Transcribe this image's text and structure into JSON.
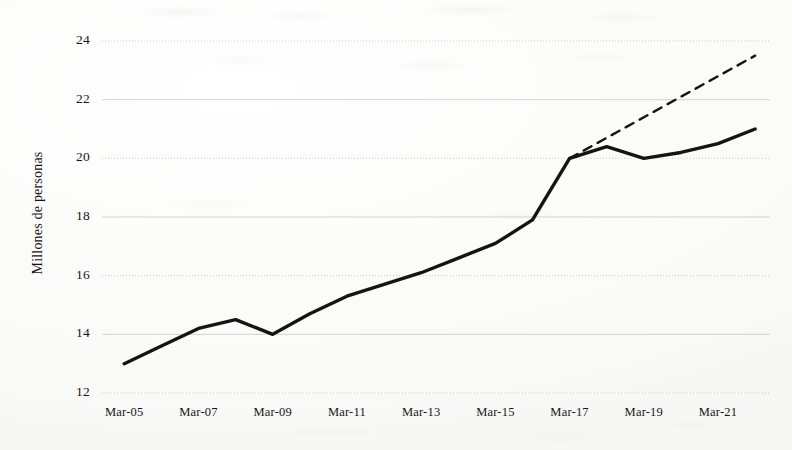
{
  "chart_data": {
    "type": "line",
    "title": "",
    "subtitle": "",
    "xlabel": "",
    "ylabel": "Millones de personas",
    "ylim": [
      12,
      24
    ],
    "ytick_values": [
      12,
      14,
      16,
      18,
      20,
      22,
      24
    ],
    "ytick_labels": [
      "12",
      "14",
      "16",
      "18",
      "20",
      "22",
      "24"
    ],
    "xtick_labels": [
      "Mar-05",
      "Mar-07",
      "Mar-09",
      "Mar-11",
      "Mar-13",
      "Mar-15",
      "Mar-17",
      "Mar-19",
      "Mar-21"
    ],
    "xtick_values": [
      2005,
      2007,
      2009,
      2011,
      2013,
      2015,
      2017,
      2019,
      2021
    ],
    "xlim": [
      2004.4,
      2022.4
    ],
    "grid": true,
    "grid_axis": "y",
    "legend": false,
    "legend_position": "none",
    "series": [
      {
        "name": "Serie observada",
        "style": "solid",
        "color": "#141414",
        "width": 3.4,
        "x": [
          2005,
          2006,
          2007,
          2008,
          2009,
          2010,
          2011,
          2012,
          2013,
          2014,
          2015,
          2016,
          2017,
          2018,
          2019,
          2020,
          2021,
          2022
        ],
        "values": [
          13.0,
          13.6,
          14.2,
          14.5,
          14.0,
          14.7,
          15.3,
          15.7,
          16.1,
          16.6,
          17.1,
          17.9,
          20.0,
          20.4,
          20.0,
          20.2,
          20.5,
          21.0
        ]
      },
      {
        "name": "Tendencia proyectada",
        "style": "dashed",
        "color": "#141414",
        "width": 2.4,
        "x": [
          2017,
          2022
        ],
        "values": [
          20.0,
          23.5
        ]
      }
    ],
    "annotations": []
  },
  "axis": {
    "y_label": "Millones de personas"
  },
  "ticks": {
    "y": [
      {
        "label": "24",
        "value": 24
      },
      {
        "label": "22",
        "value": 22
      },
      {
        "label": "20",
        "value": 20
      },
      {
        "label": "18",
        "value": 18
      },
      {
        "label": "16",
        "value": 16
      },
      {
        "label": "14",
        "value": 14
      },
      {
        "label": "12",
        "value": 12
      }
    ],
    "x": [
      {
        "label": "Mar-05",
        "value": 2005
      },
      {
        "label": "Mar-07",
        "value": 2007
      },
      {
        "label": "Mar-09",
        "value": 2009
      },
      {
        "label": "Mar-11",
        "value": 2011
      },
      {
        "label": "Mar-13",
        "value": 2013
      },
      {
        "label": "Mar-15",
        "value": 2015
      },
      {
        "label": "Mar-17",
        "value": 2017
      },
      {
        "label": "Mar-19",
        "value": 2019
      },
      {
        "label": "Mar-21",
        "value": 2021
      }
    ]
  },
  "colors": {
    "line": "#141414",
    "grid": "#b9b9bb",
    "text": "#161616",
    "background": "#fdfdfc"
  }
}
